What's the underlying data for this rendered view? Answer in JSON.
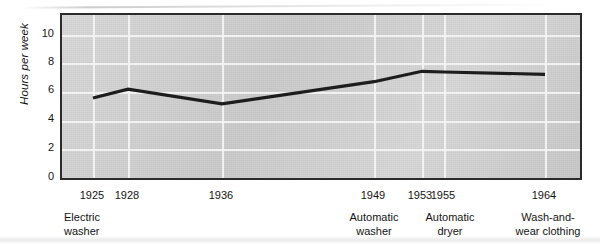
{
  "chart_data": {
    "type": "line",
    "title": "",
    "xlabel": "",
    "ylabel": "Hours per week",
    "ylim": [
      0,
      11
    ],
    "yticks": [
      0,
      2,
      4,
      6,
      8,
      10
    ],
    "grid": true,
    "legend": "none",
    "x": [
      "1925",
      "1928",
      "1936",
      "1949",
      "1953",
      "1955",
      "1964"
    ],
    "values": [
      5.4,
      6.0,
      5.0,
      6.5,
      7.2,
      7.15,
      7.0
    ],
    "annotations": [
      {
        "x": "1925",
        "text": "Electric\nwasher"
      },
      {
        "x": "1949",
        "text": "Automatic\nwasher"
      },
      {
        "x": "1953",
        "text": "Automatic\ndryer"
      },
      {
        "x": "1964",
        "text": "Wash-and-\nwear clothing"
      }
    ],
    "colors": {
      "line": "#1d1d1d",
      "plot_background": "#d3d3d3",
      "gridline": "#f4f4f4",
      "frame": "#2b2b2b",
      "text": "#141414"
    }
  },
  "axis": {
    "y": {
      "label": "Hours per week",
      "ticks": [
        "10",
        "8",
        "6",
        "4",
        "2",
        "0"
      ]
    },
    "x": {
      "ticks": [
        "1925",
        "1928",
        "1936",
        "1949",
        "1953",
        "1955",
        "1964"
      ]
    }
  },
  "annotations": {
    "electric_washer": "Electric\nwasher",
    "automatic_washer": "Automatic\nwasher",
    "automatic_dryer": "Automatic\ndryer",
    "wash_and_wear": "Wash-and-\nwear clothing"
  }
}
